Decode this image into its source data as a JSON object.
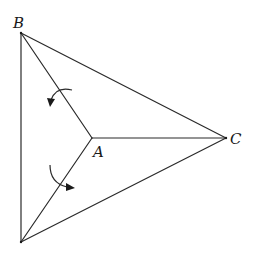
{
  "diagram": {
    "type": "geometric-figure",
    "vertices": {
      "B": {
        "label": "B",
        "x": 21,
        "y": 33
      },
      "C": {
        "label": "C",
        "x": 226,
        "y": 138
      },
      "D": {
        "label": "",
        "x": 21,
        "y": 242
      },
      "A": {
        "label": "A",
        "x": 92,
        "y": 138
      }
    },
    "labels": {
      "B": "B",
      "A": "A",
      "C": "C"
    },
    "edges": [
      [
        "B",
        "C"
      ],
      [
        "B",
        "D"
      ],
      [
        "D",
        "C"
      ],
      [
        "A",
        "B"
      ],
      [
        "A",
        "C"
      ],
      [
        "A",
        "D"
      ]
    ],
    "rotation_arrows": [
      {
        "name": "upper-rotation-arrow",
        "near_edge": [
          "A",
          "B"
        ],
        "direction": "counterclockwise"
      },
      {
        "name": "lower-rotation-arrow",
        "near_edge": [
          "A",
          "D"
        ],
        "direction": "counterclockwise"
      }
    ],
    "colors": {
      "line": "#2a2a2a",
      "background": "#ffffff"
    }
  }
}
